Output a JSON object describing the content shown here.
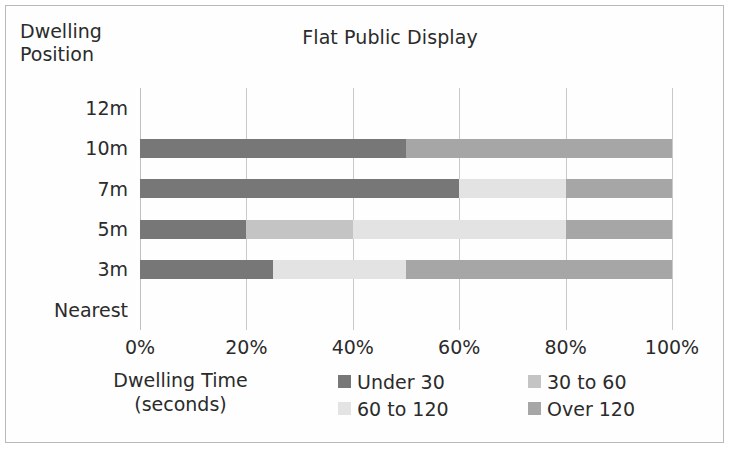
{
  "chart_data": {
    "type": "bar",
    "orientation": "horizontal",
    "stacked": true,
    "stack_mode": "percent",
    "title": "Flat Public Display",
    "xlabel": "Dwelling Time (seconds)",
    "xlabel_line1": "Dwelling Time",
    "xlabel_line2": "(seconds)",
    "ylabel": "Dwelling Position",
    "ylabel_line1": "Dwelling",
    "ylabel_line2": "Position",
    "categories": [
      "12m",
      "10m",
      "7m",
      "5m",
      "3m",
      "Nearest"
    ],
    "xlim": [
      0,
      100
    ],
    "xticks": [
      0,
      20,
      40,
      60,
      80,
      100
    ],
    "xticklabels": [
      "0%",
      "20%",
      "40%",
      "60%",
      "80%",
      "100%"
    ],
    "grid": true,
    "grid_axis": "x",
    "legend_position": "bottom",
    "series": [
      {
        "name": "Under 30",
        "color": "#777777",
        "values": [
          0,
          50,
          60,
          20,
          25,
          0
        ]
      },
      {
        "name": "30 to 60",
        "color": "#c4c4c4",
        "values": [
          0,
          0,
          0,
          20,
          0,
          0
        ]
      },
      {
        "name": "60 to 120",
        "color": "#e3e3e3",
        "values": [
          0,
          0,
          20,
          40,
          25,
          0
        ]
      },
      {
        "name": "Over 120",
        "color": "#a6a6a6",
        "values": [
          0,
          50,
          20,
          20,
          50,
          0
        ]
      }
    ]
  },
  "colors": {
    "under_30": "#777777",
    "30_to_60": "#c4c4c4",
    "60_to_120": "#e3e3e3",
    "over_120": "#a6a6a6",
    "gridline": "#c9c9c9",
    "text": "#2b2b2b",
    "frame": "#b9b9b9",
    "background": "#ffffff"
  }
}
